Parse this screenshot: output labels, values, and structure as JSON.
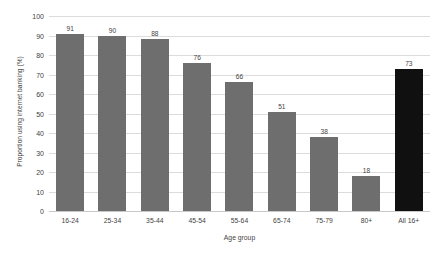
{
  "chart_data": {
    "type": "bar",
    "title": "",
    "xlabel": "Age group",
    "ylabel": "Proportion using internet banking (%)",
    "categories": [
      "16-24",
      "25-34",
      "35-44",
      "45-54",
      "55-64",
      "65-74",
      "75-79",
      "80+",
      "All 16+"
    ],
    "values": [
      91,
      90,
      88,
      76,
      66,
      51,
      38,
      18,
      73
    ],
    "value_labels": [
      "91",
      "90",
      "88",
      "76",
      "66",
      "51",
      "38",
      "18",
      "73"
    ],
    "ylim": [
      0,
      100
    ],
    "ytick_labels": [
      "0",
      "10",
      "20",
      "30",
      "40",
      "50",
      "60",
      "70",
      "80",
      "90",
      "100"
    ],
    "ytick_values": [
      0,
      10,
      20,
      30,
      40,
      50,
      60,
      70,
      80,
      90,
      100
    ],
    "grid": true,
    "legend": "none",
    "bar_colors": [
      "#6e6e6e",
      "#6e6e6e",
      "#6e6e6e",
      "#6e6e6e",
      "#6e6e6e",
      "#6e6e6e",
      "#6e6e6e",
      "#6e6e6e",
      "#101010"
    ],
    "series_color": "#6e6e6e",
    "highlight_color": "#101010",
    "gridline_color": "#dcdcdc",
    "background_color": "#ffffff"
  }
}
